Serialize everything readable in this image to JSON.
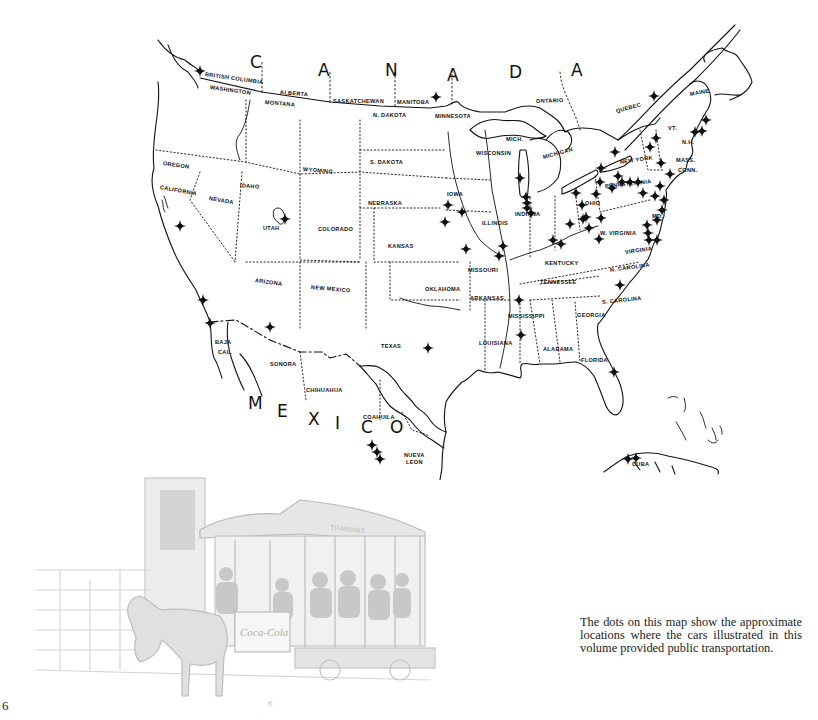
{
  "page": {
    "number": "6"
  },
  "caption": "The dots on this map show the approximate locations where the cars illustrated in this volume provided public transportation.",
  "map": {
    "country_labels": [
      {
        "text": "C",
        "x": 250,
        "y": 62
      },
      {
        "text": "A",
        "x": 318,
        "y": 70
      },
      {
        "text": "N",
        "x": 385,
        "y": 70
      },
      {
        "text": "A",
        "x": 447,
        "y": 75
      },
      {
        "text": "D",
        "x": 509,
        "y": 72
      },
      {
        "text": "A",
        "x": 571,
        "y": 70
      },
      {
        "text": "M",
        "x": 248,
        "y": 403
      },
      {
        "text": "E",
        "x": 277,
        "y": 411
      },
      {
        "text": "X",
        "x": 308,
        "y": 419
      },
      {
        "text": "I",
        "x": 335,
        "y": 423
      },
      {
        "text": "C",
        "x": 361,
        "y": 427
      },
      {
        "text": "O",
        "x": 390,
        "y": 427
      }
    ],
    "region_labels": [
      {
        "text": "BRITISH COLUMBIA",
        "x": 205,
        "y": 74,
        "rot": 8
      },
      {
        "text": "WASHINGTON",
        "x": 210,
        "y": 87,
        "rot": 8
      },
      {
        "text": "ALBERTA",
        "x": 280,
        "y": 92,
        "rot": 5
      },
      {
        "text": "MONTANA",
        "x": 265,
        "y": 102,
        "rot": 5
      },
      {
        "text": "SASKATCHEWAN",
        "x": 333,
        "y": 101,
        "rot": 0
      },
      {
        "text": "MANITOBA",
        "x": 397,
        "y": 102,
        "rot": 0
      },
      {
        "text": "N. DAKOTA",
        "x": 373,
        "y": 115,
        "rot": 0
      },
      {
        "text": "MINNESOTA",
        "x": 435,
        "y": 116,
        "rot": 0
      },
      {
        "text": "ONTARIO",
        "x": 536,
        "y": 101,
        "rot": -2
      },
      {
        "text": "QUEBEC",
        "x": 616,
        "y": 111,
        "rot": -15
      },
      {
        "text": "MAINE",
        "x": 690,
        "y": 94,
        "rot": -10
      },
      {
        "text": "VT.",
        "x": 668,
        "y": 128,
        "rot": 0
      },
      {
        "text": "N.H.",
        "x": 682,
        "y": 142,
        "rot": 0
      },
      {
        "text": "MASS.",
        "x": 676,
        "y": 160,
        "rot": 0
      },
      {
        "text": "CONN.",
        "x": 678,
        "y": 170,
        "rot": 0
      },
      {
        "text": "OREGON",
        "x": 163,
        "y": 163,
        "rot": 8
      },
      {
        "text": "IDAHO",
        "x": 240,
        "y": 185,
        "rot": 5
      },
      {
        "text": "WYOMING",
        "x": 303,
        "y": 169,
        "rot": 5
      },
      {
        "text": "S. DAKOTA",
        "x": 370,
        "y": 162,
        "rot": 0
      },
      {
        "text": "WISCONSIN",
        "x": 476,
        "y": 153,
        "rot": 0
      },
      {
        "text": "MICH.",
        "x": 506,
        "y": 139,
        "rot": 0
      },
      {
        "text": "MICHIGAN",
        "x": 543,
        "y": 157,
        "rot": -15
      },
      {
        "text": "NEW YORK",
        "x": 620,
        "y": 162,
        "rot": -8
      },
      {
        "text": "CALIFORNIA",
        "x": 160,
        "y": 187,
        "rot": 10
      },
      {
        "text": "NEVADA",
        "x": 209,
        "y": 198,
        "rot": 10
      },
      {
        "text": "NEBRASKA",
        "x": 368,
        "y": 203,
        "rot": 0
      },
      {
        "text": "IOWA",
        "x": 447,
        "y": 194,
        "rot": 0
      },
      {
        "text": "ILLINOIS",
        "x": 482,
        "y": 223,
        "rot": 0
      },
      {
        "text": "INDIANA",
        "x": 515,
        "y": 214,
        "rot": 0
      },
      {
        "text": "OHIO",
        "x": 585,
        "y": 203,
        "rot": 0
      },
      {
        "text": "PENNSYLVANIA",
        "x": 605,
        "y": 186,
        "rot": -6
      },
      {
        "text": "UTAH",
        "x": 263,
        "y": 228,
        "rot": 0
      },
      {
        "text": "COLORADO",
        "x": 318,
        "y": 229,
        "rot": 0
      },
      {
        "text": "KANSAS",
        "x": 388,
        "y": 246,
        "rot": 0
      },
      {
        "text": "MD.",
        "x": 652,
        "y": 216,
        "rot": 0
      },
      {
        "text": "W. VIRGINIA",
        "x": 600,
        "y": 233,
        "rot": 0
      },
      {
        "text": "KENTUCKY",
        "x": 545,
        "y": 263,
        "rot": 0
      },
      {
        "text": "VIRGINIA",
        "x": 625,
        "y": 252,
        "rot": -8
      },
      {
        "text": "MISSOURI",
        "x": 468,
        "y": 270,
        "rot": 0
      },
      {
        "text": "ARIZONA",
        "x": 255,
        "y": 280,
        "rot": 8
      },
      {
        "text": "NEW MEXICO",
        "x": 311,
        "y": 287,
        "rot": 5
      },
      {
        "text": "OKLAHOMA",
        "x": 425,
        "y": 289,
        "rot": 0
      },
      {
        "text": "TENNESSEE",
        "x": 540,
        "y": 282,
        "rot": 0
      },
      {
        "text": "N. CAROLINA",
        "x": 610,
        "y": 270,
        "rot": -8
      },
      {
        "text": "ARKANSAS",
        "x": 470,
        "y": 298,
        "rot": 0
      },
      {
        "text": "S. CAROLINA",
        "x": 602,
        "y": 302,
        "rot": -6
      },
      {
        "text": "MISSISSIPPI",
        "x": 508,
        "y": 316,
        "rot": 0
      },
      {
        "text": "GEORGIA",
        "x": 577,
        "y": 315,
        "rot": 0
      },
      {
        "text": "BAJA",
        "x": 215,
        "y": 342,
        "rot": 0
      },
      {
        "text": "CAL.",
        "x": 218,
        "y": 352,
        "rot": 0
      },
      {
        "text": "TEXAS",
        "x": 381,
        "y": 346,
        "rot": 0
      },
      {
        "text": "LOUISIANA",
        "x": 479,
        "y": 343,
        "rot": 0
      },
      {
        "text": "ALABAMA",
        "x": 543,
        "y": 349,
        "rot": 0
      },
      {
        "text": "FLORIDA",
        "x": 581,
        "y": 360,
        "rot": 0
      },
      {
        "text": "SONORA",
        "x": 270,
        "y": 364,
        "rot": 0
      },
      {
        "text": "CHIHUAHUA",
        "x": 306,
        "y": 390,
        "rot": 0
      },
      {
        "text": "COAHUILA",
        "x": 363,
        "y": 417,
        "rot": 0
      },
      {
        "text": "NUEVA",
        "x": 404,
        "y": 455,
        "rot": 0
      },
      {
        "text": "LEON",
        "x": 406,
        "y": 462,
        "rot": 0
      },
      {
        "text": "CUBA",
        "x": 632,
        "y": 464,
        "rot": 0
      }
    ],
    "markers": [
      [
        200,
        71
      ],
      [
        436,
        97
      ],
      [
        654,
        96
      ],
      [
        706,
        120
      ],
      [
        695,
        132
      ],
      [
        702,
        131
      ],
      [
        520,
        178
      ],
      [
        448,
        205
      ],
      [
        462,
        212
      ],
      [
        445,
        222
      ],
      [
        466,
        249
      ],
      [
        503,
        246
      ],
      [
        499,
        256
      ],
      [
        526,
        197
      ],
      [
        527,
        203
      ],
      [
        527,
        208
      ],
      [
        531,
        213
      ],
      [
        615,
        152
      ],
      [
        601,
        168
      ],
      [
        618,
        176
      ],
      [
        661,
        163
      ],
      [
        650,
        147
      ],
      [
        656,
        138
      ],
      [
        670,
        174
      ],
      [
        596,
        194
      ],
      [
        570,
        224
      ],
      [
        583,
        219
      ],
      [
        601,
        218
      ],
      [
        600,
        182
      ],
      [
        612,
        188
      ],
      [
        622,
        182
      ],
      [
        630,
        182
      ],
      [
        638,
        182
      ],
      [
        643,
        193
      ],
      [
        655,
        196
      ],
      [
        660,
        186
      ],
      [
        664,
        200
      ],
      [
        662,
        210
      ],
      [
        657,
        220
      ],
      [
        647,
        225
      ],
      [
        648,
        233
      ],
      [
        649,
        240
      ],
      [
        657,
        240
      ],
      [
        586,
        217
      ],
      [
        589,
        228
      ],
      [
        553,
        240
      ],
      [
        561,
        244
      ],
      [
        576,
        193
      ],
      [
        582,
        205
      ],
      [
        599,
        239
      ],
      [
        620,
        285
      ],
      [
        519,
        300
      ],
      [
        521,
        335
      ],
      [
        614,
        372
      ],
      [
        628,
        459
      ],
      [
        636,
        458
      ],
      [
        285,
        219
      ],
      [
        180,
        226
      ],
      [
        203,
        300
      ],
      [
        210,
        323
      ],
      [
        270,
        327
      ],
      [
        428,
        348
      ],
      [
        372,
        445
      ],
      [
        377,
        452
      ],
      [
        380,
        459
      ]
    ]
  },
  "illustration": {
    "description": "horse-drawn streetcar with Coca-Cola sign",
    "car_sign": "TRANVIAS",
    "ad_text": "Coca-Cola",
    "artist_mark": "K"
  }
}
